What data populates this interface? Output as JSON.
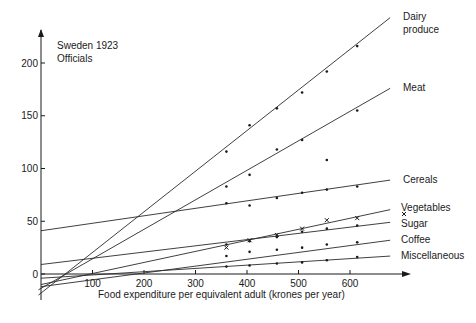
{
  "chart_data": {
    "type": "line",
    "title": "Sweden 1923",
    "subtitle": "Officials",
    "xlabel": "Food expenditure per equivalent adult (krones per year)",
    "ylabel": "",
    "xlim": [
      0,
      720
    ],
    "ylim": [
      -20,
      220
    ],
    "x_ticks": [
      100,
      200,
      300,
      400,
      500,
      600
    ],
    "y_ticks": [
      0,
      50,
      100,
      150,
      200
    ],
    "grid": false,
    "legend_position": "inline-right",
    "series": [
      {
        "name": "Dairy produce",
        "label_lines": [
          "Dairy",
          "produce"
        ],
        "marker": "dot",
        "fit": {
          "x0": -5,
          "y0": -20,
          "x1": 678,
          "y1": 243
        },
        "points": [
          [
            360,
            116
          ],
          [
            405,
            141
          ],
          [
            458,
            157
          ],
          [
            507,
            172
          ],
          [
            555,
            192
          ],
          [
            614,
            216
          ]
        ]
      },
      {
        "name": "Meat",
        "label_lines": [
          "Meat"
        ],
        "marker": "dot",
        "fit": {
          "x0": -5,
          "y0": -15,
          "x1": 678,
          "y1": 176
        },
        "points": [
          [
            360,
            83
          ],
          [
            405,
            94
          ],
          [
            458,
            118
          ],
          [
            507,
            127
          ],
          [
            555,
            108
          ],
          [
            614,
            155
          ]
        ]
      },
      {
        "name": "Cereals",
        "label_lines": [
          "Cereals"
        ],
        "marker": "dot",
        "fit": {
          "x0": 0,
          "y0": 41,
          "x1": 678,
          "y1": 89
        },
        "points": [
          [
            360,
            67
          ],
          [
            405,
            65
          ],
          [
            458,
            72
          ],
          [
            507,
            77
          ],
          [
            555,
            80
          ],
          [
            614,
            83
          ]
        ]
      },
      {
        "name": "Vegetables",
        "label_lines": [
          "Vegetables"
        ],
        "marker": "cross",
        "fit": {
          "x0": 0,
          "y0": -10,
          "x1": 678,
          "y1": 61
        },
        "points": [
          [
            360,
            25
          ],
          [
            405,
            32
          ],
          [
            458,
            37
          ],
          [
            507,
            43
          ],
          [
            555,
            51
          ],
          [
            614,
            53
          ]
        ]
      },
      {
        "name": "Sugar",
        "label_lines": [
          "Sugar"
        ],
        "marker": "dot",
        "fit": {
          "x0": 0,
          "y0": 9,
          "x1": 678,
          "y1": 49
        },
        "points": [
          [
            360,
            28
          ],
          [
            405,
            31
          ],
          [
            458,
            35
          ],
          [
            507,
            40
          ],
          [
            555,
            43
          ],
          [
            614,
            46
          ]
        ]
      },
      {
        "name": "Coffee",
        "label_lines": [
          "Coffee"
        ],
        "marker": "dot",
        "fit": {
          "x0": 0,
          "y0": -12,
          "x1": 678,
          "y1": 32
        },
        "points": [
          [
            360,
            17
          ],
          [
            405,
            21
          ],
          [
            458,
            23
          ],
          [
            507,
            25
          ],
          [
            555,
            28
          ],
          [
            614,
            30
          ]
        ]
      },
      {
        "name": "Miscellaneous",
        "label_lines": [
          "Miscellaneous"
        ],
        "marker": "dot",
        "fit": {
          "x0": 0,
          "y0": -4,
          "x1": 678,
          "y1": 17
        },
        "points": [
          [
            360,
            7
          ],
          [
            405,
            8
          ],
          [
            458,
            10
          ],
          [
            507,
            11
          ],
          [
            555,
            13
          ],
          [
            614,
            16
          ]
        ]
      }
    ]
  }
}
